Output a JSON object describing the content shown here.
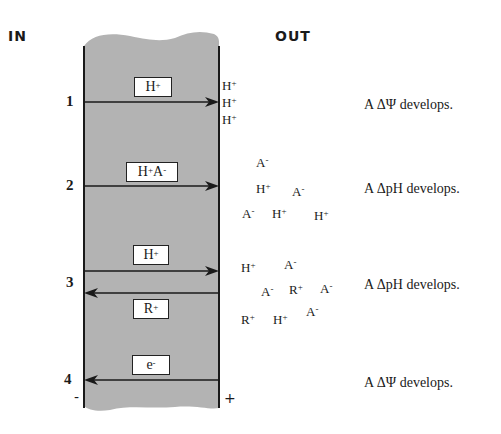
{
  "labels": {
    "inside": "IN",
    "outside": "OUT",
    "minus": "-",
    "plus": "+"
  },
  "colors": {
    "membrane": "#b3b3b3",
    "line": "#1a1a1a"
  },
  "mechanisms": [
    {
      "number": "1",
      "box": {
        "base": "H",
        "sup": "+"
      },
      "direction": "in-to-out",
      "out_ions": [
        {
          "b": "H",
          "s": "+"
        },
        {
          "b": "H",
          "s": "+"
        },
        {
          "b": "H",
          "s": "+"
        }
      ],
      "result": "A ΔΨ develops."
    },
    {
      "number": "2",
      "box": {
        "base": "H",
        "sup": "+",
        "base2": "A",
        "sup2": "-"
      },
      "direction": "in-to-out",
      "out_ions": [
        {
          "b": "A",
          "s": "-"
        },
        {
          "b": "H",
          "s": "+"
        },
        {
          "b": "A",
          "s": "-"
        },
        {
          "b": "A",
          "s": "-"
        },
        {
          "b": "H",
          "s": "+"
        },
        {
          "b": "H",
          "s": "+"
        }
      ],
      "result": "A ΔpH develops."
    },
    {
      "number": "3",
      "box": {
        "base": "H",
        "sup": "+"
      },
      "box2": {
        "base": "R",
        "sup": "+"
      },
      "direction": "antiport",
      "out_ions": [
        {
          "b": "H",
          "s": "+"
        },
        {
          "b": "A",
          "s": "-"
        },
        {
          "b": "A",
          "s": "-"
        },
        {
          "b": "R",
          "s": "+"
        },
        {
          "b": "A",
          "s": "-"
        },
        {
          "b": "R",
          "s": "+"
        },
        {
          "b": "H",
          "s": "+"
        },
        {
          "b": "A",
          "s": "-"
        }
      ],
      "result": "A ΔpH develops."
    },
    {
      "number": "4",
      "box": {
        "base": "e",
        "sup": "-"
      },
      "direction": "out-to-in",
      "result": "A ΔΨ develops."
    }
  ]
}
